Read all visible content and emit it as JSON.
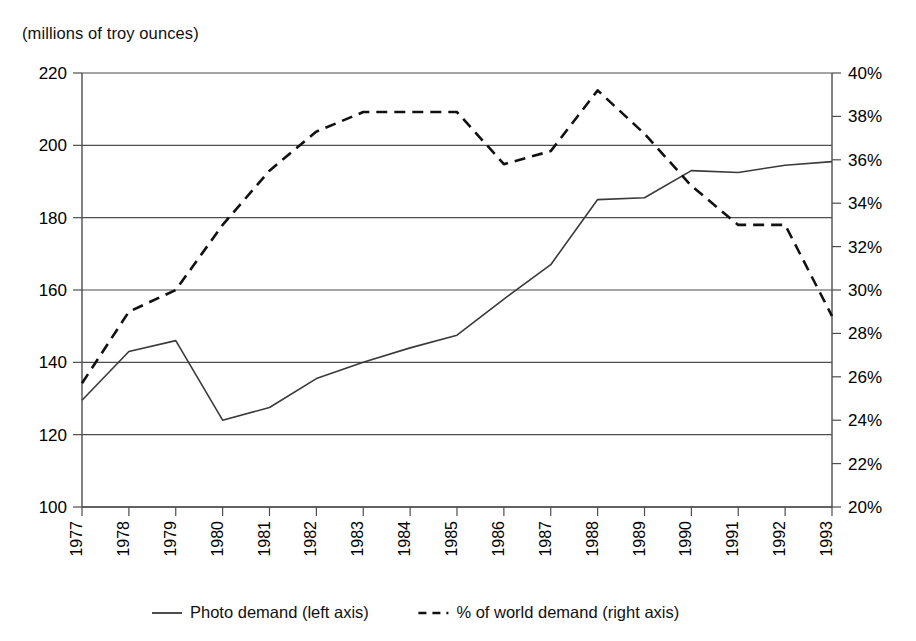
{
  "caption": "(millions of troy ounces)",
  "chart_data": {
    "type": "line",
    "title": "",
    "subtitle": "",
    "xlabel": "",
    "ylabel": "(millions of troy ounces)",
    "y2label": "",
    "grid": true,
    "legend_position": "bottom",
    "x": [
      1977,
      1978,
      1979,
      1980,
      1981,
      1982,
      1983,
      1984,
      1985,
      1986,
      1987,
      1988,
      1989,
      1990,
      1991,
      1992,
      1993
    ],
    "categories": [
      "1977",
      "1978",
      "1979",
      "1980",
      "1981",
      "1982",
      "1983",
      "1984",
      "1985",
      "1986",
      "1987",
      "1988",
      "1989",
      "1990",
      "1991",
      "1992",
      "1993"
    ],
    "ylim": [
      100,
      220
    ],
    "yticks": [
      100,
      120,
      140,
      160,
      180,
      200,
      220
    ],
    "ytick_labels": [
      "100",
      "120",
      "140",
      "160",
      "180",
      "200",
      "220"
    ],
    "y2lim": [
      20,
      40
    ],
    "y2ticks": [
      20,
      22,
      24,
      26,
      28,
      30,
      32,
      34,
      36,
      38,
      40
    ],
    "y2tick_labels": [
      "20%",
      "22%",
      "24%",
      "26%",
      "28%",
      "30%",
      "32%",
      "34%",
      "36%",
      "38%",
      "40%"
    ],
    "series": [
      {
        "name": "Photo demand (left axis)",
        "axis": "left",
        "style": "solid",
        "color": "#3a3a3a",
        "values": [
          129.5,
          143.0,
          146.0,
          124.0,
          127.5,
          135.5,
          140.0,
          144.0,
          147.5,
          157.5,
          167.0,
          185.0,
          185.5,
          193.0,
          192.5,
          194.5,
          195.5
        ]
      },
      {
        "name": "% of world demand (right axis)",
        "axis": "right",
        "style": "dashed",
        "color": "#111111",
        "values": [
          25.7,
          29.0,
          30.0,
          33.0,
          35.5,
          37.3,
          38.2,
          38.2,
          38.2,
          35.8,
          36.4,
          39.2,
          37.2,
          34.8,
          33.0,
          33.0,
          28.8
        ]
      }
    ]
  },
  "legend": {
    "items": [
      {
        "label": "Photo demand (left axis)",
        "style": "solid"
      },
      {
        "label": "% of world demand (right axis)",
        "style": "dashed"
      }
    ]
  }
}
